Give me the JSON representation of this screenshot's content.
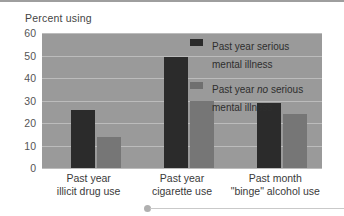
{
  "axis_title": "Percent using",
  "legend": [
    {
      "swatch": "dark",
      "line1": "Past year serious",
      "line2": "mental illness",
      "italic": ""
    },
    {
      "swatch": "light",
      "line1": "Past year ",
      "line2": "mental illness",
      "italic": "no"
    }
  ],
  "legend_items": {
    "serious": "Past year serious\nmental illness",
    "no_serious_pre": "Past year ",
    "no_serious_italic": "no",
    "no_serious_post": " serious\nmental illness"
  },
  "colors": {
    "series_dark": "#2b2b2b",
    "series_light": "#767676",
    "plot_background": "#9a9a9a",
    "gridline": "#bcbcbc",
    "page_background": "#ffffff"
  },
  "chart_data": {
    "type": "bar",
    "title": "Percent using",
    "xlabel": "",
    "ylabel": "Percent using",
    "ylim": [
      0,
      60
    ],
    "yticks": [
      0,
      10,
      20,
      30,
      40,
      50,
      60
    ],
    "grid": true,
    "legend_position": "inside-top-right",
    "categories": [
      "Past year\nillicit drug use",
      "Past year\ncigarette use",
      "Past month\n\"binge\" alcohol use"
    ],
    "category_lines": [
      [
        "Past year",
        "illicit drug use"
      ],
      [
        "Past year",
        "cigarette use"
      ],
      [
        "Past month",
        "\"binge\" alcohol use"
      ]
    ],
    "series": [
      {
        "name": "Past year serious mental illness",
        "color": "#2b2b2b",
        "values": [
          25.6,
          49.5,
          29.0
        ]
      },
      {
        "name": "Past year no serious mental illness",
        "color": "#767676",
        "values": [
          14.0,
          30.0,
          24.0
        ]
      }
    ]
  }
}
